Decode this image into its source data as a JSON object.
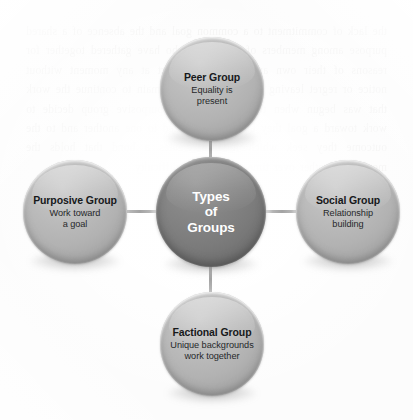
{
  "diagram": {
    "type": "hub-and-spoke",
    "title": "Types of Groups",
    "background_texture": "scanned book page with faint reversed ghost text bleed-through",
    "ghost_text": "the lack of commitment to a common goal and the absence of a shared purpose among members of the group who have gathered together for reasons of their own and who may depart at any moment without notice or regret leaving behind those who remain to continue the work that was begun when the members of a purposive group decide to work toward a goal they become committed to one another and to the outcome they seek which in turn creates a bond that holds the members together over time and through difficulty",
    "colors": {
      "center_fill": "#7b7b7b",
      "center_text": "#ffffff",
      "satellite_fill": "#b2b2b2",
      "satellite_title_text": "#17191b",
      "satellite_desc_text": "#26282a",
      "connector_line": "#9e9e9e",
      "page_background": "#fcfcfc"
    },
    "center_node": {
      "id": "types-of-groups",
      "label_line_1": "Types",
      "label_line_2": "of",
      "label_line_3": "Groups"
    },
    "nodes": [
      {
        "id": "peer-group",
        "position": "top",
        "title": "Peer Group",
        "desc_line_1": "Equality is",
        "desc_line_2": "present"
      },
      {
        "id": "purposive-group",
        "position": "left",
        "title": "Purposive Group",
        "desc_line_1": "Work toward",
        "desc_line_2": "a goal"
      },
      {
        "id": "social-group",
        "position": "right",
        "title": "Social Group",
        "desc_line_1": "Relationship",
        "desc_line_2": "building"
      },
      {
        "id": "factional-group",
        "position": "bottom",
        "title": "Factional Group",
        "desc_line_1": "Unique backgrounds",
        "desc_line_2": "work together"
      }
    ]
  }
}
